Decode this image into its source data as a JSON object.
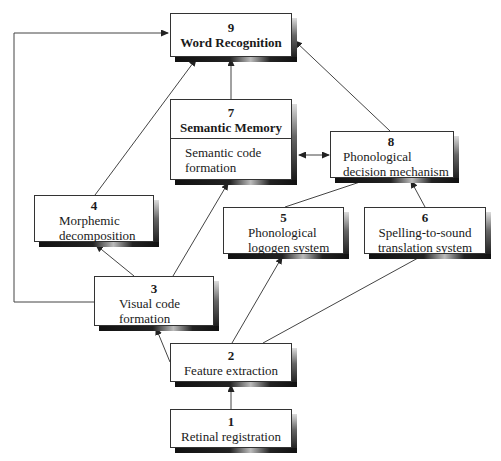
{
  "diagram": {
    "nodes": [
      {
        "id": "9",
        "number": "9",
        "label": "Word Recognition",
        "bold_label": true
      },
      {
        "id": "7",
        "number": "7",
        "label": "Semantic Memory",
        "bold_label": true,
        "sublabel": "Semantic code formation",
        "sublabel_lines": [
          "Semantic code",
          "formation"
        ]
      },
      {
        "id": "8",
        "number": "8",
        "label": "Phonological decision mechanism",
        "label_lines": [
          "Phonological",
          "decision mechanism"
        ]
      },
      {
        "id": "4",
        "number": "4",
        "label": "Morphemic decomposition",
        "label_lines": [
          "Morphemic",
          "decomposition"
        ]
      },
      {
        "id": "5",
        "number": "5",
        "label": "Phonological logogen system",
        "label_lines": [
          "Phonological",
          "logogen system"
        ]
      },
      {
        "id": "6",
        "number": "6",
        "label": "Spelling-to-sound translation system",
        "label_lines": [
          "Spelling-to-sound",
          "translation system"
        ]
      },
      {
        "id": "3",
        "number": "3",
        "label": "Visual code formation",
        "label_lines": [
          "Visual code",
          "formation"
        ]
      },
      {
        "id": "2",
        "number": "2",
        "label": "Feature extraction"
      },
      {
        "id": "1",
        "number": "1",
        "label": "Retinal registration"
      }
    ],
    "edges": [
      {
        "from": "1",
        "to": "2",
        "arrow": "end"
      },
      {
        "from": "2",
        "to": "3",
        "arrow": "end"
      },
      {
        "from": "2",
        "to": "5",
        "arrow": "end"
      },
      {
        "from": "2",
        "to": "6",
        "arrow": "none"
      },
      {
        "from": "3",
        "to": "4",
        "arrow": "end"
      },
      {
        "from": "3",
        "to": "7",
        "arrow": "end"
      },
      {
        "from": "3",
        "to": "9",
        "arrow": "end",
        "route": "left feedback"
      },
      {
        "from": "4",
        "to": "9",
        "arrow": "end"
      },
      {
        "from": "5",
        "to": "8",
        "arrow": "none"
      },
      {
        "from": "6",
        "to": "8",
        "arrow": "end"
      },
      {
        "from": "7",
        "to": "9",
        "arrow": "end"
      },
      {
        "from": "7",
        "to": "8",
        "arrow": "both"
      },
      {
        "from": "8",
        "to": "9",
        "arrow": "end"
      }
    ]
  }
}
